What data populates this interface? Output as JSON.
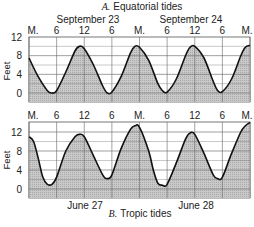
{
  "chart_data": [
    {
      "type": "area",
      "title_letter": "A.",
      "title": "Equatorial tides",
      "date_labels": [
        "September 23",
        "September 24"
      ],
      "x_tick_labels": [
        "M.",
        "6",
        "12",
        "6",
        "M.",
        "6",
        "12",
        "6",
        "M."
      ],
      "x_hours": [
        0,
        6,
        12,
        18,
        24,
        30,
        36,
        42,
        48
      ],
      "ylabel": "Feet",
      "y_tick_labels": [
        "12",
        "8",
        "4",
        "0"
      ],
      "yticks": [
        12,
        8,
        4,
        0
      ],
      "ylim": [
        -2,
        12
      ],
      "grid": true,
      "series": [
        {
          "name": "Tide height",
          "hours": [
            0,
            2,
            4,
            5,
            6,
            8,
            10,
            11,
            12,
            14,
            16,
            17,
            18,
            20,
            22,
            23,
            24,
            26,
            28,
            29,
            30,
            32,
            34,
            35,
            36,
            38,
            40,
            41,
            42,
            44,
            46,
            47,
            48
          ],
          "values": [
            7.5,
            3.5,
            0.5,
            0.0,
            0.5,
            4.5,
            9.0,
            10.0,
            9.5,
            6.0,
            1.5,
            0.0,
            0.2,
            3.5,
            8.5,
            10.0,
            9.8,
            7.0,
            2.0,
            0.5,
            0.2,
            3.0,
            8.0,
            9.8,
            10.0,
            7.5,
            2.5,
            0.5,
            0.3,
            3.0,
            8.0,
            9.8,
            10.2
          ]
        }
      ]
    },
    {
      "type": "area",
      "title_letter": "B.",
      "title": "Tropic tides",
      "date_labels": [
        "June 27",
        "June 28"
      ],
      "x_tick_labels": [
        "M.",
        "6",
        "12",
        "6",
        "M.",
        "6",
        "12",
        "6",
        "M."
      ],
      "x_hours": [
        0,
        6,
        12,
        18,
        24,
        30,
        36,
        42,
        48
      ],
      "ylabel": "Feet",
      "y_tick_labels": [
        "12",
        "8",
        "4",
        "0"
      ],
      "yticks": [
        12,
        8,
        4,
        0
      ],
      "ylim": [
        -2,
        14
      ],
      "grid": true,
      "series": [
        {
          "name": "Tide height",
          "hours": [
            0,
            1,
            2,
            3,
            4,
            5,
            6,
            8,
            10,
            11,
            12,
            14,
            16,
            17,
            18,
            20,
            22,
            23,
            24,
            26,
            27,
            28,
            29,
            30,
            32,
            34,
            35,
            36,
            38,
            40,
            41,
            42,
            44,
            46,
            47,
            48
          ],
          "values": [
            11.0,
            10.0,
            6.5,
            2.5,
            1.0,
            1.0,
            2.5,
            8.0,
            11.0,
            11.5,
            11.0,
            7.0,
            3.0,
            2.2,
            3.0,
            8.5,
            12.5,
            13.3,
            13.0,
            8.0,
            4.0,
            1.2,
            0.8,
            1.0,
            5.5,
            10.5,
            11.8,
            11.5,
            7.5,
            3.0,
            2.2,
            2.5,
            7.5,
            12.0,
            13.3,
            14.0
          ]
        }
      ]
    }
  ]
}
